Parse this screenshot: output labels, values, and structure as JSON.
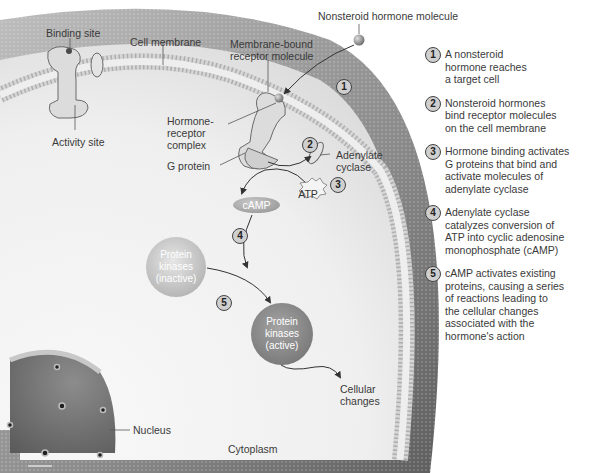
{
  "figure": {
    "title_label": "Nonsteroid hormone molecule",
    "labels": {
      "binding_site": "Binding site",
      "cell_membrane": "Cell membrane",
      "membrane_receptor": "Membrane-bound\nreceptor molecule",
      "hormone_receptor_complex": "Hormone-\nreceptor\ncomplex",
      "activity_site": "Activity site",
      "g_protein": "G protein",
      "adenylate_cyclase": "Adenylate\ncyclase",
      "atp": "ATP",
      "camp": "cAMP",
      "protein_kinases_inactive": "Protein\nkinases\n(inactive)",
      "protein_kinases_active": "Protein\nkinases\n(active)",
      "cellular_changes": "Cellular\nchanges",
      "nucleus": "Nucleus",
      "cytoplasm": "Cytoplasm"
    },
    "diagram_badges": [
      "1",
      "2",
      "3",
      "4",
      "5"
    ]
  },
  "steps": [
    {
      "num": "1",
      "text": "A nonsteroid\nhormone reaches\na target cell"
    },
    {
      "num": "2",
      "text": "Nonsteroid hormones\nbind receptor molecules\non the cell membrane"
    },
    {
      "num": "3",
      "text": "Hormone binding activates\nG proteins that bind and\nactivate molecules of\nadenylate cyclase"
    },
    {
      "num": "4",
      "text": "Adenylate cyclase\ncatalyzes conversion of\nATP into cyclic adenosine\nmonophosphate (cAMP)"
    },
    {
      "num": "5",
      "text": "cAMP activates existing\nproteins, causing a series\nof reactions leading to\nthe cellular changes\nassociated with the\nhormone's action"
    }
  ],
  "colors": {
    "cytoplasm": "#f2f2f2",
    "membrane_dark": "#7a7a7a",
    "membrane_light": "#d8d8d8",
    "nucleus": "#6f6f6f",
    "badge_fill": "#cfcfcf"
  }
}
